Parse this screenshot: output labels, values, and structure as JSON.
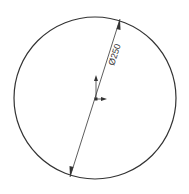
{
  "drawing": {
    "dimension_label": "Ø250",
    "colors": {
      "line": "#333333",
      "background": "#ffffff"
    }
  }
}
